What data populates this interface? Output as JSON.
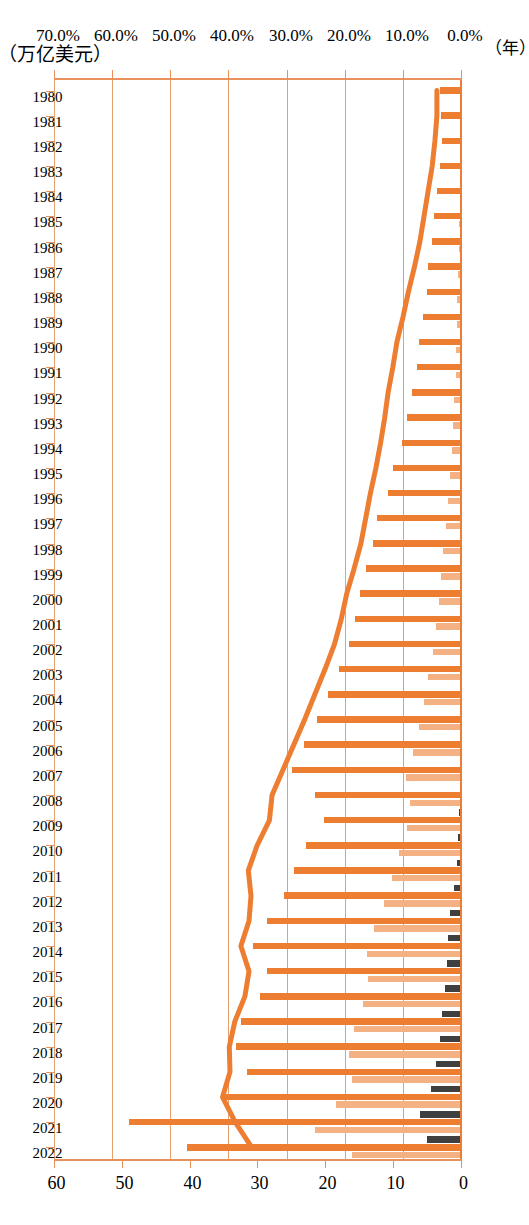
{
  "chart_data": {
    "type": "bar",
    "title": "",
    "subtitle": "",
    "orientation": "horizontal-rotated",
    "xlabel": "（年）",
    "ylabel": "（万亿美元）",
    "secondary_axis_label_percent": "%",
    "percent_axis": {
      "ticks": [
        "0.0%",
        "10.0%",
        "20.0%",
        "30.0%",
        "40.0%",
        "50.0%",
        "60.0%",
        "70.0%"
      ],
      "min": 0,
      "max": 70,
      "unit": "%"
    },
    "value_axis": {
      "ticks": [
        "0",
        "10",
        "20",
        "30",
        "40",
        "50",
        "60"
      ],
      "min": 0,
      "max": 60,
      "unit": "万亿美元"
    },
    "grid": true,
    "legend_position": "none",
    "categories": [
      "1980",
      "1981",
      "1982",
      "1983",
      "1984",
      "1985",
      "1986",
      "1987",
      "1988",
      "1989",
      "1990",
      "1991",
      "1992",
      "1993",
      "1994",
      "1995",
      "1996",
      "1997",
      "1998",
      "1999",
      "2000",
      "2001",
      "2002",
      "2003",
      "2004",
      "2005",
      "2006",
      "2007",
      "2008",
      "2009",
      "2010",
      "2011",
      "2012",
      "2013",
      "2014",
      "2015",
      "2016",
      "2017",
      "2018",
      "2019",
      "2020",
      "2021",
      "2022"
    ],
    "series": [
      {
        "name": "series-gray",
        "color": "#3F3F3F",
        "axis": "percent",
        "values": [
          0.0,
          0.0,
          0.0,
          0.0,
          0.0,
          0.0,
          0.0,
          0.0,
          0.0,
          0.0,
          0.0,
          0.0,
          0.0,
          0.0,
          0.0,
          0.0,
          0.0,
          0.0,
          0.0,
          0.0,
          0.0,
          0.0,
          0.0,
          0.1,
          0.2,
          0.3,
          0.3,
          0.4,
          0.4,
          0.5,
          0.7,
          0.9,
          1.3,
          2.0,
          2.4,
          2.6,
          2.9,
          3.4,
          3.8,
          4.5,
          5.4,
          7.2,
          6.0
        ]
      },
      {
        "name": "series-dark-orange",
        "color": "#ED7D31",
        "axis": "percent",
        "values": [
          3.8,
          3.6,
          3.5,
          3.8,
          4.3,
          4.8,
          5.2,
          5.9,
          6.1,
          6.7,
          7.4,
          7.8,
          8.6,
          9.4,
          10.4,
          11.8,
          12.8,
          14.6,
          15.3,
          16.5,
          17.6,
          18.4,
          19.5,
          21.2,
          23.1,
          24.9,
          27.1,
          29.3,
          25.3,
          23.7,
          26.8,
          28.9,
          30.6,
          33.5,
          35.9,
          33.6,
          34.8,
          38.0,
          38.8,
          36.9,
          40.7,
          57.2,
          47.3
        ]
      },
      {
        "name": "series-light-orange",
        "color": "#F4B183",
        "axis": "percent",
        "values": [
          0.2,
          0.2,
          0.3,
          0.3,
          0.4,
          0.5,
          0.6,
          0.7,
          0.8,
          0.9,
          1.0,
          1.1,
          1.3,
          1.5,
          1.8,
          2.0,
          2.4,
          2.8,
          3.2,
          3.6,
          4.0,
          4.4,
          5.0,
          5.8,
          6.6,
          7.4,
          8.5,
          9.6,
          9.0,
          9.4,
          10.8,
          12.0,
          13.4,
          15.1,
          16.4,
          16.2,
          17.1,
          18.6,
          19.4,
          19.0,
          21.6,
          25.2,
          18.9
        ]
      }
    ],
    "line_series": {
      "name": "line-value",
      "color": "#ED7D31",
      "axis": "value",
      "values": [
        3.7,
        3.7,
        4.0,
        4.4,
        5.0,
        5.6,
        6.2,
        7.0,
        7.9,
        8.7,
        9.6,
        10.2,
        10.9,
        11.4,
        12.0,
        12.7,
        13.5,
        14.2,
        14.9,
        15.9,
        17.0,
        17.8,
        18.8,
        20.2,
        21.7,
        23.2,
        24.8,
        26.4,
        28.0,
        28.4,
        30.2,
        31.5,
        31.1,
        31.4,
        32.6,
        31.4,
        32.0,
        33.5,
        34.3,
        34.2,
        35.3,
        33.4,
        31.0
      ]
    },
    "notes": {
      "bar_order_per_year": [
        "series-gray",
        "series-dark-orange",
        "series-light-orange"
      ],
      "bar_direction": "right-to-left (0% at right edge)"
    }
  }
}
